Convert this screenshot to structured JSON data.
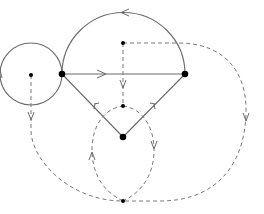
{
  "diagram": {
    "type": "graph-with-dual",
    "width": 264,
    "height": 214,
    "colors": {
      "background": "#ffffff",
      "solid_edge": "#6a6a6a",
      "dashed_edge": "#7a7a7a",
      "node": "#000000"
    },
    "primal_vertices": [
      {
        "id": "A",
        "x": 62,
        "y": 74,
        "size": "large"
      },
      {
        "id": "B",
        "x": 185,
        "y": 74,
        "size": "large"
      },
      {
        "id": "C",
        "x": 123,
        "y": 137,
        "size": "large"
      }
    ],
    "dual_vertices": [
      {
        "id": "d_loop",
        "x": 31,
        "y": 75,
        "size": "small"
      },
      {
        "id": "d_top",
        "x": 123,
        "y": 43,
        "size": "small"
      },
      {
        "id": "d_mid",
        "x": 123,
        "y": 106,
        "size": "small"
      },
      {
        "id": "d_bottom",
        "x": 123,
        "y": 201,
        "size": "small"
      }
    ],
    "primal_edges": [
      {
        "id": "loop_A",
        "type": "loop",
        "at": "A",
        "arrow": "downward-on-left"
      },
      {
        "id": "arc_AB",
        "from": "B",
        "to": "A",
        "type": "semicircle-arc",
        "arrow": "leftward-at-top"
      },
      {
        "id": "AB",
        "from": "A",
        "to": "B",
        "type": "straight",
        "arrow": "rightward"
      },
      {
        "id": "CA",
        "from": "C",
        "to": "A",
        "type": "straight",
        "arrow": "toward-A"
      },
      {
        "id": "CB",
        "from": "C",
        "to": "B",
        "type": "straight",
        "arrow": "toward-B"
      }
    ],
    "dual_edges": [
      {
        "id": "top_mid",
        "from": "d_top",
        "to": "d_mid",
        "style": "dashed",
        "arrow": "downward"
      },
      {
        "id": "top_outer",
        "from": "d_top",
        "to": "d_bottom",
        "style": "dashed",
        "route": "around-right",
        "arrow": "downward-on-right"
      },
      {
        "id": "loop_outer",
        "from": "d_loop",
        "to": "d_bottom",
        "style": "dashed",
        "route": "around-left",
        "arrow": "downward"
      },
      {
        "id": "mid_left",
        "from": "d_bottom",
        "to": "d_mid",
        "style": "dashed",
        "route": "left-arc",
        "arrow": "upward"
      },
      {
        "id": "mid_right",
        "from": "d_mid",
        "to": "d_bottom",
        "style": "dashed",
        "route": "right-arc",
        "arrow": "downward"
      }
    ]
  }
}
